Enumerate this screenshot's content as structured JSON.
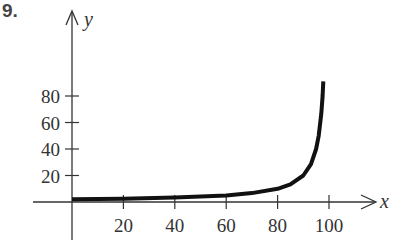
{
  "problem_number": "9.",
  "chart_data": {
    "type": "line",
    "title": "",
    "xlabel": "x",
    "ylabel": "y",
    "x_ticks": [
      20,
      40,
      60,
      80,
      100
    ],
    "y_ticks": [
      20,
      40,
      60,
      80
    ],
    "xlim": [
      -15,
      120
    ],
    "ylim": [
      -20,
      100
    ],
    "grid": false,
    "series": [
      {
        "name": "curve",
        "x": [
          0,
          20,
          40,
          60,
          70,
          80,
          85,
          90,
          93,
          95,
          96,
          97,
          97.5,
          97.8
        ],
        "y": [
          2,
          2.5,
          3.3,
          5,
          6.7,
          10,
          13.3,
          20,
          28.6,
          40,
          50,
          66.7,
          80,
          91
        ]
      }
    ]
  }
}
